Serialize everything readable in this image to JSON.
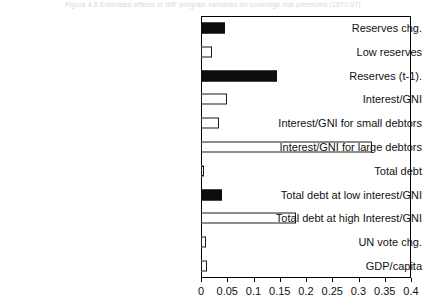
{
  "caption": "Figure 4.6  Estimated effects of IMF program variables on sovereign risk premiums (1971-97)",
  "chart_data": {
    "type": "bar",
    "orientation": "horizontal",
    "title": "",
    "xlabel": "",
    "ylabel": "",
    "xlim": [
      0,
      0.4
    ],
    "xticks": [
      "0",
      "0.05",
      "0.1",
      "0.15",
      "0.2",
      "0.25",
      "0.3",
      "0.35",
      "0.4"
    ],
    "xtick_values": [
      0,
      0.05,
      0.1,
      0.15,
      0.2,
      0.25,
      0.3,
      0.35,
      0.4
    ],
    "grid": false,
    "legend": "none",
    "categories": [
      "Reserves chg.",
      "Low reserves",
      "Reserves (t-1).",
      "Interest/GNI",
      "Interest/GNI for small debtors",
      "Interest/GNI for large debtors",
      "Total debt",
      "Total debt at low interest/GNI",
      "Total debt at high Interest/GNI",
      "UN vote chg.",
      "GDP/capita"
    ],
    "values": [
      0.045,
      0.02,
      0.145,
      0.05,
      0.035,
      0.325,
      0.005,
      0.04,
      0.18,
      0.01,
      0.012
    ],
    "fills": [
      "solid",
      "hollow",
      "solid",
      "hollow",
      "hollow",
      "hollow",
      "hollow",
      "solid",
      "hollow",
      "hollow",
      "hollow"
    ],
    "colors": {
      "solid_fill": "#0d0d0d",
      "hollow_fill": "#ffffff",
      "bar_outline": "#1a1a1a",
      "axis": "#000000",
      "text": "#111111"
    }
  }
}
